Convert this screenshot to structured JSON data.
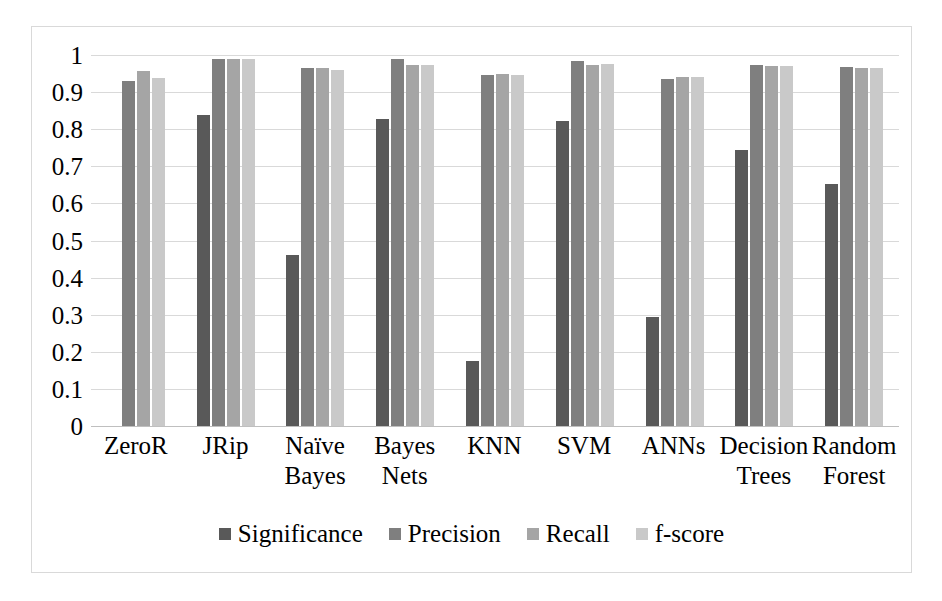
{
  "chart_data": {
    "type": "bar",
    "title": "",
    "subtitle": "",
    "xlabel": "",
    "ylabel": "",
    "ylim": [
      0,
      1
    ],
    "yticks": [
      "0",
      "0.1",
      "0.2",
      "0.3",
      "0.4",
      "0.5",
      "0.6",
      "0.7",
      "0.8",
      "0.9",
      "1"
    ],
    "grid": true,
    "legend_position": "bottom",
    "categories": [
      "ZeroR",
      "JRip",
      "Naïve Bayes",
      "Bayes Nets",
      "KNN",
      "SVM",
      "ANNs",
      "Decision Trees",
      "Random Forest"
    ],
    "category_lines": [
      [
        "ZeroR",
        ""
      ],
      [
        "JRip",
        ""
      ],
      [
        "Naïve",
        "Bayes"
      ],
      [
        "Bayes",
        "Nets"
      ],
      [
        "KNN",
        ""
      ],
      [
        "SVM",
        ""
      ],
      [
        "ANNs",
        ""
      ],
      [
        "Decision",
        "Trees"
      ],
      [
        "Random",
        "Forest"
      ]
    ],
    "series": [
      {
        "name": "Significance",
        "color": "#595959",
        "values": [
          0,
          0.838,
          0.46,
          0.828,
          0.175,
          0.823,
          0.295,
          0.745,
          0.652
        ]
      },
      {
        "name": "Precision",
        "color": "#7f7f7f",
        "values": [
          0.93,
          0.988,
          0.965,
          0.988,
          0.945,
          0.985,
          0.935,
          0.972,
          0.967
        ]
      },
      {
        "name": "Recall",
        "color": "#a5a5a5",
        "values": [
          0.957,
          0.988,
          0.965,
          0.973,
          0.95,
          0.973,
          0.94,
          0.97,
          0.965
        ]
      },
      {
        "name": "f-score",
        "color": "#c9c9c9",
        "values": [
          0.938,
          0.988,
          0.96,
          0.973,
          0.945,
          0.977,
          0.94,
          0.97,
          0.965
        ]
      }
    ]
  },
  "legend": {
    "items": [
      {
        "label": "Significance",
        "color": "#595959"
      },
      {
        "label": "Precision",
        "color": "#7f7f7f"
      },
      {
        "label": "Recall",
        "color": "#a5a5a5"
      },
      {
        "label": "f-score",
        "color": "#c9c9c9"
      }
    ]
  },
  "style": {
    "gridline_color": "#d9d9d9",
    "baseline_color": "#bfbfbf",
    "border_color": "#d9d9d9",
    "background": "#ffffff",
    "text_color": "#000000"
  }
}
